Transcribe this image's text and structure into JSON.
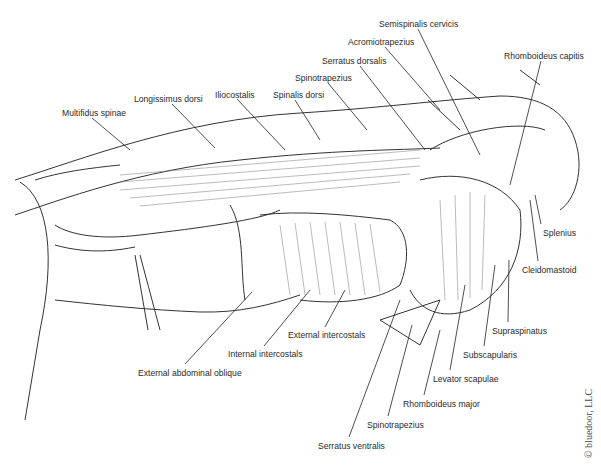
{
  "figure": {
    "copyright": "© bluedoor, LLC",
    "labels": [
      {
        "id": "multifidus-spinae",
        "text": "Multifidus spinae",
        "x": 62,
        "y": 108
      },
      {
        "id": "longissimus-dorsi",
        "text": "Longissimus dorsi",
        "x": 134,
        "y": 94
      },
      {
        "id": "iliocostalis",
        "text": "Iliocostalis",
        "x": 215,
        "y": 90
      },
      {
        "id": "spinalis-dorsi",
        "text": "Spinalis dorsi",
        "x": 273,
        "y": 90
      },
      {
        "id": "spinotrapezius-top",
        "text": "Spinotrapezius",
        "x": 295,
        "y": 73
      },
      {
        "id": "serratus-dorsalis",
        "text": "Serratus dorsalis",
        "x": 322,
        "y": 56
      },
      {
        "id": "acromiotrapezius",
        "text": "Acromiotrapezius",
        "x": 348,
        "y": 37
      },
      {
        "id": "semispinalis-cervicis",
        "text": "Semispinalis cervicis",
        "x": 379,
        "y": 19
      },
      {
        "id": "rhomboideus-capitis",
        "text": "Rhomboideus capitis",
        "x": 504,
        "y": 51
      },
      {
        "id": "splenius",
        "text": "Splenius",
        "x": 543,
        "y": 228
      },
      {
        "id": "cleidomastoid",
        "text": "Cleidomastoid",
        "x": 522,
        "y": 265
      },
      {
        "id": "supraspinatus",
        "text": "Supraspinatus",
        "x": 492,
        "y": 326
      },
      {
        "id": "subscapularis",
        "text": "Subscapularis",
        "x": 463,
        "y": 350
      },
      {
        "id": "levator-scapulae",
        "text": "Levator scapulae",
        "x": 433,
        "y": 374
      },
      {
        "id": "rhomboideus-major",
        "text": "Rhomboideus major",
        "x": 403,
        "y": 399
      },
      {
        "id": "spinotrapezius-bottom",
        "text": "Spinotrapezius",
        "x": 367,
        "y": 420
      },
      {
        "id": "serratus-ventralis",
        "text": "Serratus ventralis",
        "x": 318,
        "y": 441
      },
      {
        "id": "external-intercostals",
        "text": "External intercostals",
        "x": 288,
        "y": 330
      },
      {
        "id": "internal-intercostals",
        "text": "Internal intercostals",
        "x": 228,
        "y": 349
      },
      {
        "id": "external-abdominal-oblique",
        "text": "External abdominal oblique",
        "x": 138,
        "y": 368
      }
    ]
  }
}
